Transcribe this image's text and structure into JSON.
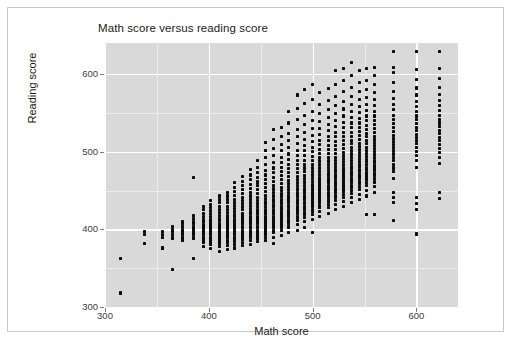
{
  "figure": {
    "title": "Math score versus reading score",
    "background": "#ffffff",
    "panel_background": "#d9d9d9",
    "gridline_major_color": "#ffffff",
    "gridline_minor_color": "#ececec",
    "point_color": "#0a0a0a",
    "border_color": "#c8c8c8"
  },
  "axes": {
    "x": {
      "label": "Math score",
      "ticks": [
        "300",
        "400",
        "500",
        "600"
      ],
      "tick_values": [
        300,
        400,
        500,
        600
      ],
      "range": [
        300,
        640
      ]
    },
    "y": {
      "label": "Reading score",
      "ticks": [
        "300",
        "400",
        "500",
        "600"
      ],
      "tick_values": [
        300,
        400,
        500,
        600
      ],
      "range": [
        300,
        640
      ]
    }
  },
  "chart_data": {
    "type": "scatter",
    "title": "Math score versus reading score",
    "xlabel": "Math score",
    "ylabel": "Reading score",
    "xlim": [
      300,
      640
    ],
    "ylim": [
      300,
      640
    ],
    "xticks": [
      300,
      400,
      500,
      600
    ],
    "yticks": [
      300,
      400,
      500,
      600
    ],
    "grid": true,
    "minor_grid": true,
    "legend": null,
    "marker": "square",
    "marker_color": "#0a0a0a",
    "marker_size": 3,
    "columns": [
      {
        "x": 315,
        "y": [
          318,
          362
        ]
      },
      {
        "x": 338,
        "y": [
          382,
          393,
          397
        ]
      },
      {
        "x": 355,
        "y": [
          375,
          376,
          390,
          393,
          397
        ]
      },
      {
        "x": 365,
        "y": [
          348,
          388,
          390,
          393,
          397,
          400,
          404
        ]
      },
      {
        "x": 375,
        "y": [
          386,
          388,
          390,
          393,
          395,
          397,
          400,
          404,
          407,
          410
        ]
      },
      {
        "x": 385,
        "y": [
          362,
          388,
          390,
          393,
          395,
          397,
          400,
          403,
          407,
          410,
          414,
          418,
          467
        ]
      },
      {
        "x": 395,
        "y": [
          378,
          383,
          386,
          388,
          390,
          393,
          395,
          397,
          400,
          403,
          406,
          410,
          413,
          417,
          421,
          425,
          430
        ]
      },
      {
        "x": 402,
        "y": [
          375,
          380,
          383,
          386,
          388,
          390,
          393,
          395,
          397,
          400,
          403,
          406,
          409,
          412,
          416,
          420,
          424,
          428,
          432,
          437
        ]
      },
      {
        "x": 410,
        "y": [
          372,
          378,
          382,
          385,
          388,
          390,
          392,
          395,
          397,
          400,
          402,
          405,
          408,
          411,
          414,
          418,
          422,
          426,
          430,
          434,
          439,
          443
        ]
      },
      {
        "x": 418,
        "y": [
          374,
          379,
          383,
          386,
          389,
          391,
          393,
          396,
          398,
          401,
          403,
          406,
          409,
          412,
          415,
          418,
          422,
          426,
          430,
          434,
          438,
          443,
          448
        ]
      },
      {
        "x": 425,
        "y": [
          376,
          381,
          385,
          388,
          390,
          393,
          395,
          397,
          400,
          402,
          405,
          407,
          410,
          413,
          416,
          419,
          423,
          427,
          431,
          435,
          439,
          444,
          449,
          454,
          460
        ]
      },
      {
        "x": 432,
        "y": [
          379,
          383,
          387,
          390,
          392,
          395,
          397,
          399,
          402,
          404,
          407,
          409,
          412,
          415,
          418,
          421,
          425,
          429,
          433,
          437,
          441,
          446,
          451,
          456,
          462,
          468
        ]
      },
      {
        "x": 440,
        "y": [
          381,
          386,
          389,
          392,
          394,
          397,
          399,
          402,
          404,
          407,
          409,
          412,
          414,
          417,
          420,
          423,
          427,
          431,
          435,
          439,
          443,
          448,
          453,
          458,
          464,
          470,
          477
        ]
      },
      {
        "x": 447,
        "y": [
          384,
          388,
          391,
          394,
          397,
          399,
          402,
          404,
          407,
          409,
          412,
          414,
          417,
          420,
          423,
          426,
          430,
          433,
          437,
          441,
          446,
          451,
          456,
          461,
          467,
          473,
          480,
          489
        ]
      },
      {
        "x": 455,
        "y": [
          386,
          390,
          394,
          397,
          400,
          402,
          405,
          407,
          410,
          412,
          415,
          417,
          420,
          423,
          426,
          429,
          433,
          436,
          440,
          444,
          449,
          454,
          459,
          464,
          470,
          476,
          483,
          492,
          501,
          512
        ]
      },
      {
        "x": 462,
        "y": [
          382,
          390,
          396,
          399,
          402,
          405,
          407,
          410,
          412,
          415,
          417,
          420,
          423,
          426,
          429,
          432,
          436,
          439,
          443,
          447,
          452,
          457,
          462,
          467,
          473,
          479,
          486,
          495,
          504,
          516,
          529
        ]
      },
      {
        "x": 470,
        "y": [
          392,
          399,
          403,
          406,
          409,
          411,
          414,
          417,
          419,
          422,
          424,
          427,
          430,
          433,
          436,
          439,
          443,
          446,
          450,
          454,
          459,
          464,
          469,
          474,
          480,
          486,
          493,
          501,
          509,
          519,
          531
        ]
      },
      {
        "x": 477,
        "y": [
          396,
          403,
          407,
          410,
          413,
          416,
          418,
          421,
          423,
          426,
          429,
          431,
          434,
          437,
          440,
          443,
          447,
          451,
          455,
          459,
          463,
          468,
          473,
          478,
          484,
          490,
          497,
          505,
          514,
          524,
          537,
          552
        ]
      },
      {
        "x": 485,
        "y": [
          399,
          406,
          411,
          414,
          417,
          420,
          423,
          425,
          428,
          430,
          433,
          436,
          439,
          442,
          445,
          448,
          452,
          456,
          460,
          464,
          468,
          473,
          478,
          483,
          489,
          495,
          502,
          510,
          519,
          529,
          541,
          556,
          573
        ]
      },
      {
        "x": 492,
        "y": [
          402,
          410,
          415,
          419,
          422,
          425,
          427,
          430,
          433,
          435,
          438,
          441,
          444,
          447,
          450,
          453,
          457,
          461,
          465,
          469,
          474,
          479,
          484,
          489,
          495,
          501,
          508,
          516,
          525,
          535,
          547,
          562,
          580
        ]
      },
      {
        "x": 500,
        "y": [
          396,
          413,
          419,
          423,
          426,
          429,
          432,
          435,
          437,
          440,
          443,
          446,
          449,
          452,
          455,
          458,
          462,
          466,
          470,
          474,
          479,
          484,
          489,
          494,
          500,
          506,
          513,
          521,
          530,
          540,
          552,
          567,
          587
        ]
      },
      {
        "x": 507,
        "y": [
          417,
          423,
          428,
          431,
          434,
          437,
          440,
          443,
          446,
          449,
          452,
          455,
          458,
          461,
          464,
          467,
          471,
          475,
          479,
          483,
          488,
          493,
          498,
          503,
          509,
          515,
          522,
          530,
          539,
          549,
          561,
          576
        ]
      },
      {
        "x": 515,
        "y": [
          421,
          428,
          432,
          436,
          439,
          442,
          445,
          448,
          451,
          454,
          457,
          460,
          463,
          466,
          469,
          472,
          476,
          480,
          484,
          488,
          493,
          498,
          503,
          508,
          514,
          520,
          527,
          535,
          544,
          554,
          566,
          581
        ]
      },
      {
        "x": 522,
        "y": [
          425,
          432,
          437,
          441,
          444,
          447,
          450,
          453,
          456,
          459,
          462,
          465,
          468,
          471,
          474,
          477,
          481,
          485,
          489,
          493,
          498,
          503,
          508,
          513,
          519,
          525,
          532,
          540,
          549,
          559,
          571,
          586,
          605
        ]
      },
      {
        "x": 530,
        "y": [
          429,
          436,
          441,
          445,
          449,
          452,
          455,
          458,
          461,
          464,
          467,
          470,
          473,
          476,
          479,
          483,
          487,
          491,
          495,
          499,
          504,
          509,
          514,
          519,
          525,
          531,
          538,
          546,
          555,
          565,
          577,
          592,
          607
        ]
      },
      {
        "x": 537,
        "y": [
          434,
          441,
          446,
          450,
          454,
          457,
          460,
          463,
          466,
          469,
          472,
          475,
          478,
          481,
          485,
          489,
          493,
          497,
          501,
          505,
          510,
          515,
          520,
          525,
          531,
          537,
          544,
          552,
          561,
          571,
          583,
          598,
          615
        ]
      },
      {
        "x": 545,
        "y": [
          438,
          445,
          451,
          455,
          459,
          462,
          465,
          468,
          471,
          474,
          477,
          481,
          484,
          487,
          491,
          495,
          499,
          503,
          507,
          511,
          516,
          521,
          526,
          531,
          537,
          543,
          550,
          558,
          567,
          577,
          589,
          604
        ]
      },
      {
        "x": 552,
        "y": [
          419,
          443,
          450,
          456,
          460,
          464,
          467,
          470,
          473,
          477,
          480,
          483,
          487,
          490,
          494,
          498,
          502,
          506,
          510,
          514,
          519,
          524,
          529,
          534,
          540,
          546,
          553,
          561,
          570,
          580,
          592,
          607
        ]
      },
      {
        "x": 560,
        "y": [
          419,
          448,
          455,
          461,
          465,
          469,
          472,
          476,
          479,
          482,
          486,
          489,
          493,
          496,
          500,
          504,
          508,
          512,
          516,
          520,
          525,
          530,
          535,
          540,
          546,
          552,
          559,
          567,
          576,
          586,
          598,
          608
        ]
      },
      {
        "x": 578,
        "y": [
          411,
          434,
          441,
          448,
          465,
          474,
          479,
          484,
          489,
          493,
          497,
          501,
          505,
          509,
          513,
          517,
          521,
          526,
          531,
          536,
          541,
          547,
          554,
          561,
          569,
          578,
          589,
          602,
          608,
          629
        ]
      },
      {
        "x": 600,
        "y": [
          394,
          425,
          433,
          441,
          480,
          489,
          495,
          500,
          505,
          510,
          514,
          518,
          522,
          527,
          531,
          536,
          541,
          546,
          552,
          558,
          565,
          573,
          582,
          593,
          606,
          629
        ]
      },
      {
        "x": 622,
        "y": [
          440,
          448,
          485,
          493,
          499,
          504,
          509,
          514,
          518,
          523,
          527,
          532,
          537,
          542,
          547,
          553,
          559,
          566,
          574,
          583,
          594,
          607,
          629
        ]
      }
    ]
  }
}
